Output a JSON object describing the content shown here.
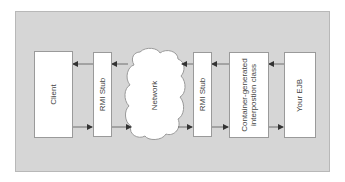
{
  "diagram": {
    "type": "architecture-flow",
    "orientation": "text rotated -90deg",
    "colors": {
      "panel": "#d6d6d6",
      "box": "#ffffff",
      "border": "#9a9a9a",
      "arrow": "#333333",
      "text": "#444444"
    },
    "nodes": [
      {
        "id": "client",
        "label": "Client",
        "shape": "rect"
      },
      {
        "id": "rmi-stub-left",
        "label": "RMI Stub",
        "shape": "rect"
      },
      {
        "id": "network",
        "label": "Network",
        "shape": "cloud"
      },
      {
        "id": "rmi-stub-right",
        "label": "RMI Stub",
        "shape": "rect"
      },
      {
        "id": "container-class",
        "label_line1": "Container-generated",
        "label_line2": "interpostion class",
        "shape": "rect"
      },
      {
        "id": "your-ejb",
        "label": "Your EJB",
        "shape": "rect"
      }
    ],
    "edges": [
      {
        "from": "client",
        "to": "rmi-stub-left",
        "direction": "right",
        "row": "bottom"
      },
      {
        "from": "rmi-stub-left",
        "to": "network",
        "direction": "right",
        "row": "bottom"
      },
      {
        "from": "network",
        "to": "rmi-stub-right",
        "direction": "right",
        "row": "bottom"
      },
      {
        "from": "rmi-stub-right",
        "to": "container-class",
        "direction": "right",
        "row": "bottom"
      },
      {
        "from": "container-class",
        "to": "your-ejb",
        "direction": "right",
        "row": "bottom"
      },
      {
        "from": "your-ejb",
        "to": "container-class",
        "direction": "left",
        "row": "top"
      },
      {
        "from": "container-class",
        "to": "rmi-stub-right",
        "direction": "left",
        "row": "top"
      },
      {
        "from": "rmi-stub-right",
        "to": "network",
        "direction": "left",
        "row": "top"
      },
      {
        "from": "network",
        "to": "rmi-stub-left",
        "direction": "left",
        "row": "top"
      },
      {
        "from": "rmi-stub-left",
        "to": "client",
        "direction": "left",
        "row": "top"
      }
    ]
  }
}
